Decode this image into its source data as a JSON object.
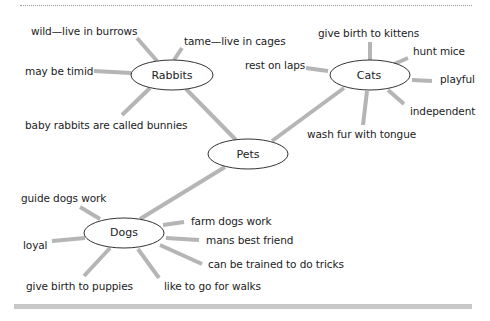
{
  "diagram": {
    "center": {
      "label": "Pets"
    },
    "nodes": [
      {
        "id": "rabbits",
        "label": "Rabbits",
        "facts": [
          "wild—live in burrows",
          "tame—live in cages",
          "may be timid",
          "baby rabbits are called bunnies"
        ]
      },
      {
        "id": "cats",
        "label": "Cats",
        "facts": [
          "give birth to kittens",
          "hunt mice",
          "rest on laps",
          "playful",
          "independent",
          "wash fur with tongue"
        ]
      },
      {
        "id": "dogs",
        "label": "Dogs",
        "facts": [
          "guide dogs work",
          "farm dogs work",
          "loyal",
          "mans  best friend",
          "can be trained to do tricks",
          "give birth to puppies",
          "like to go for walks"
        ]
      }
    ]
  },
  "colors": {
    "line": "#b5b5b5",
    "ellipse_stroke": "#333333",
    "text": "#222222",
    "bar": "#c8c8c8"
  }
}
